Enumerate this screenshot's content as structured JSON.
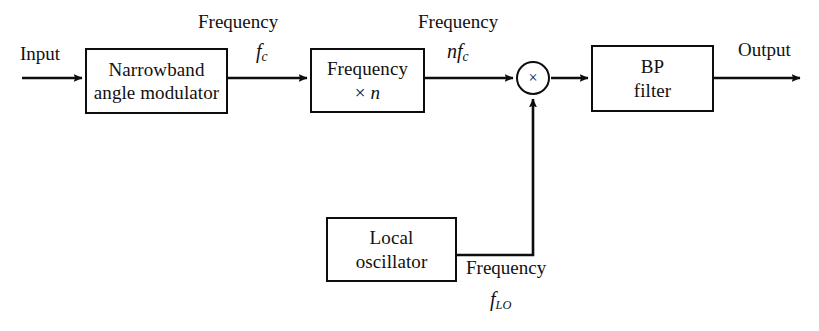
{
  "diagram": {
    "type": "signal-flow-block-diagram",
    "stroke_color": "#0d0d0d",
    "background_color": "#ffffff",
    "blocks": [
      {
        "id": "narrowband-angle-modulator",
        "lines": [
          "Narrowband",
          "angle modulator"
        ],
        "x": 85,
        "y": 48,
        "width": 143,
        "height": 66
      },
      {
        "id": "frequency-multiplier",
        "lines": [
          "Frequency",
          "× n"
        ],
        "x": 310,
        "y": 48,
        "width": 115,
        "height": 65
      },
      {
        "id": "bp-filter",
        "lines": [
          "BP",
          "filter"
        ],
        "x": 591,
        "y": 45,
        "width": 123,
        "height": 67
      },
      {
        "id": "local-oscillator",
        "lines": [
          "Local",
          "oscillator"
        ],
        "x": 326,
        "y": 217,
        "width": 131,
        "height": 65
      }
    ],
    "nodes": [
      {
        "id": "mixer",
        "symbol": "×",
        "shape": "circle",
        "cx": 533,
        "cy": 78,
        "r": 17
      }
    ],
    "labels": {
      "input": "Input",
      "output": "Output",
      "frequency_1": "Frequency",
      "frequency_2": "Frequency",
      "frequency_3": "Frequency",
      "carrier_symbol": "f",
      "carrier_subscript": "c",
      "multiplied_prefix": "n",
      "multiplied_symbol": "f",
      "multiplied_subscript": "c",
      "lo_symbol": "f",
      "lo_subscript": "LO",
      "multiplier_factor": "n",
      "multiply_sign": "×"
    },
    "blocks_text": {
      "narrowband_line1": "Narrowband",
      "narrowband_line2": "angle modulator",
      "multiplier_line1": "Frequency",
      "bp_line1": "BP",
      "bp_line2": "filter",
      "lo_line1": "Local",
      "lo_line2": "oscillator"
    },
    "connections": [
      {
        "id": "input-to-narrowband",
        "from": "input-source",
        "to": "narrowband-angle-modulator",
        "arrow": true,
        "y": 78
      },
      {
        "id": "narrowband-to-multiplier",
        "from": "narrowband-angle-modulator",
        "to": "frequency-multiplier",
        "arrow": true,
        "label": "Frequency f_c",
        "y": 78
      },
      {
        "id": "multiplier-to-mixer",
        "from": "frequency-multiplier",
        "to": "mixer",
        "arrow": true,
        "label": "Frequency n f_c",
        "y": 78
      },
      {
        "id": "mixer-to-bpfilter",
        "from": "mixer",
        "to": "bp-filter",
        "arrow": true,
        "y": 78
      },
      {
        "id": "bpfilter-to-output",
        "from": "bp-filter",
        "to": "output-sink",
        "arrow": true,
        "label": "Output",
        "y": 78
      },
      {
        "id": "lo-to-mixer",
        "from": "local-oscillator",
        "to": "mixer",
        "arrow": true,
        "label": "Frequency f_LO",
        "path": "right then up"
      }
    ]
  }
}
